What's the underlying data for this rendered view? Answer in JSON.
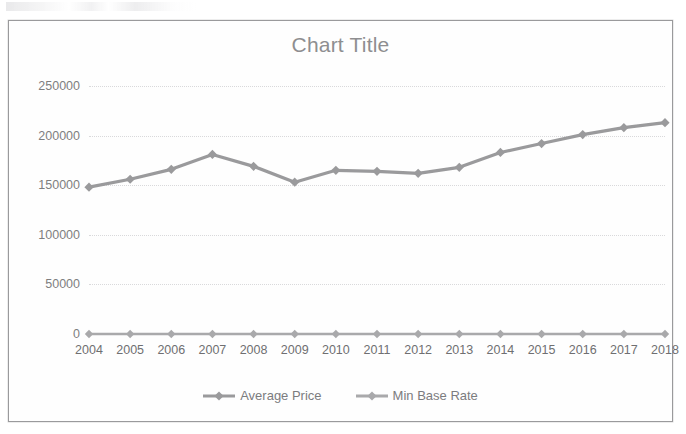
{
  "chart_data": {
    "type": "line",
    "title": "Chart Title",
    "xlabel": "",
    "ylabel": "",
    "grid": true,
    "legend_position": "bottom",
    "ylim": [
      0,
      250000
    ],
    "ytick_labels": [
      "250000",
      "200000",
      "150000",
      "100000",
      "50000",
      "0"
    ],
    "ytick_values": [
      250000,
      200000,
      150000,
      100000,
      50000,
      0
    ],
    "categories": [
      "2004",
      "2005",
      "2006",
      "2007",
      "2008",
      "2009",
      "2010",
      "2011",
      "2012",
      "2013",
      "2014",
      "2015",
      "2016",
      "2017",
      "2018"
    ],
    "series": [
      {
        "name": "Average Price",
        "color": "#9a9a9c",
        "marker": "diamond",
        "values": [
          148000,
          156000,
          166000,
          181000,
          169000,
          153000,
          165000,
          164000,
          162000,
          168000,
          183000,
          192000,
          201000,
          208000,
          213000
        ]
      },
      {
        "name": "Min Base Rate",
        "color": "#a9a9ab",
        "marker": "diamond",
        "values": [
          0,
          0,
          0,
          0,
          0,
          0,
          0,
          0,
          0,
          0,
          0,
          0,
          0,
          0,
          0
        ]
      }
    ]
  },
  "figure": {
    "border_color": "#9a9a9c",
    "background": "#ffffff",
    "title_color": "#8e8e90",
    "gridline_color": "#d9d9db",
    "tick_label_color": "#7e7e80"
  }
}
